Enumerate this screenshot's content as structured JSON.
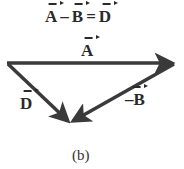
{
  "equation": {
    "term1": "A",
    "operator1": "–",
    "term2": "B",
    "operator2": "=",
    "result": "D"
  },
  "vectors": [
    {
      "name": "A",
      "label": "A",
      "from": [
        7,
        63
      ],
      "to": [
        175,
        63
      ]
    },
    {
      "name": "D",
      "label": "D",
      "from": [
        7,
        63
      ],
      "to": [
        70,
        123
      ]
    },
    {
      "name": "-B",
      "label": "–B",
      "from": [
        175,
        63
      ],
      "to": [
        70,
        123
      ]
    }
  ],
  "caption": "(b)",
  "colors": {
    "arrow": "#3a3a3a",
    "text": "#2a2a2a",
    "background": "#ffffff"
  }
}
